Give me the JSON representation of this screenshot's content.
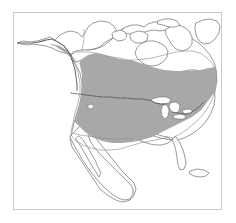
{
  "figure": {
    "kind": "species-range-map",
    "title": "",
    "caption": "",
    "region": "North America",
    "background_color": "#ffffff",
    "frame": {
      "visible": true,
      "color": "#c9c9c9",
      "x": 13,
      "y": 12,
      "width": 209,
      "height": 198
    }
  },
  "legend": {
    "visible": false,
    "entries": [
      {
        "label": "Breeding / resident range",
        "color": "#a8a8a8"
      },
      {
        "label": "Outside range",
        "color": "#ffffff"
      }
    ]
  },
  "map": {
    "projection_hint": "conic",
    "colors": {
      "range_shade": "#a8a8a8",
      "coastline": "#6e6e6e",
      "internal_border": "#8a8a8a",
      "dotted_border": "#4a4a4a",
      "lake_fill": "#ffffff",
      "land_fill": "#ffffff"
    },
    "features": [
      {
        "name": "alaska",
        "label": "Alaska",
        "shaded": "coastal-strip"
      },
      {
        "name": "canada-mainland",
        "label": "Canada",
        "shaded": "southern-portion"
      },
      {
        "name": "canadian-arctic-archipelago",
        "label": "Arctic Islands",
        "shaded": "none"
      },
      {
        "name": "greenland-edge",
        "label": "Greenland",
        "shaded": "none"
      },
      {
        "name": "hudson-bay",
        "label": "Hudson Bay",
        "shaded": "none"
      },
      {
        "name": "contiguous-united-states",
        "label": "United States",
        "shaded": "most"
      },
      {
        "name": "great-lakes",
        "label": "Great Lakes",
        "shaded": "none"
      },
      {
        "name": "florida-peninsula",
        "label": "Florida",
        "shaded": "none"
      },
      {
        "name": "mexico",
        "label": "Mexico",
        "shaded": "none"
      },
      {
        "name": "baja-california",
        "label": "Baja California",
        "shaded": "none"
      },
      {
        "name": "central-america",
        "label": "Central America",
        "shaded": "none"
      },
      {
        "name": "cuba",
        "label": "Cuba",
        "shaded": "none"
      },
      {
        "name": "newfoundland",
        "label": "Newfoundland",
        "shaded": "partial"
      },
      {
        "name": "usa-canada-border",
        "label": "49th parallel border",
        "style": "dotted"
      }
    ]
  },
  "annotations": []
}
